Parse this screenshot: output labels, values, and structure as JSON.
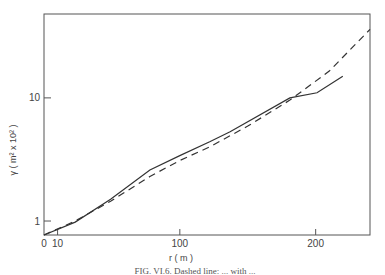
{
  "chart_data": {
    "type": "line",
    "title": "",
    "xlabel": "r ( m )",
    "ylabel": "γ ( m² x 10² )",
    "xscale": "linear",
    "yscale": "log",
    "xlim": [
      0,
      240
    ],
    "ylim": [
      0.77,
      48
    ],
    "x_ticks": [
      {
        "value": 0,
        "label": "0"
      },
      {
        "value": 10,
        "label": "10"
      },
      {
        "value": 100,
        "label": "100"
      },
      {
        "value": 200,
        "label": "200"
      }
    ],
    "y_ticks": [
      {
        "value": 1,
        "label": "1"
      },
      {
        "value": 10,
        "label": "10"
      }
    ],
    "grid": false,
    "legend": "none",
    "series": [
      {
        "name": "observed",
        "style": "solid",
        "x": [
          0,
          23,
          49,
          78,
          100,
          122,
          137,
          181,
          201,
          220
        ],
        "y": [
          0.77,
          0.98,
          1.5,
          2.6,
          3.4,
          4.4,
          5.3,
          10.0,
          11.0,
          15.0
        ]
      },
      {
        "name": "fit",
        "style": "dashed",
        "x": [
          0,
          23,
          49,
          78,
          100,
          122,
          150,
          181,
          210,
          240
        ],
        "y": [
          0.77,
          1.0,
          1.45,
          2.3,
          3.1,
          4.0,
          5.9,
          9.6,
          16.5,
          36.0
        ]
      }
    ],
    "caption": "FIG. VI.6. Dashed line: ... with ..."
  }
}
